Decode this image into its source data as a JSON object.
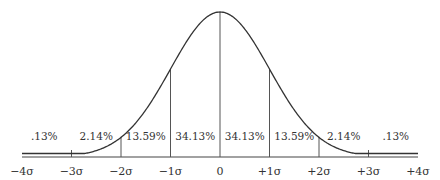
{
  "chart_data": {
    "type": "line",
    "title": "",
    "xlabel": "",
    "ylabel": "",
    "x": [
      -4,
      -3,
      -2,
      -1,
      0,
      1,
      2,
      3,
      4
    ],
    "tick_labels": [
      "−4σ",
      "−3σ",
      "−2σ",
      "−1σ",
      "0",
      "+1σ",
      "+2σ",
      "+3σ",
      "+4σ"
    ],
    "series": [
      {
        "name": "normal density",
        "values": [
          0.0001,
          0.0044,
          0.054,
          0.242,
          0.3989,
          0.242,
          0.054,
          0.0044,
          0.0001
        ]
      }
    ],
    "regions": [
      {
        "from": -4,
        "to": -3,
        "label": ".13%"
      },
      {
        "from": -3,
        "to": -2,
        "label": "2.14%"
      },
      {
        "from": -2,
        "to": -1,
        "label": "13.59%"
      },
      {
        "from": -1,
        "to": 0,
        "label": "34.13%"
      },
      {
        "from": 0,
        "to": 1,
        "label": "34.13%"
      },
      {
        "from": 1,
        "to": 2,
        "label": "13.59%"
      },
      {
        "from": 2,
        "to": 3,
        "label": "2.14%"
      },
      {
        "from": 3,
        "to": 4,
        "label": ".13%"
      }
    ],
    "xlim": [
      -4,
      4
    ],
    "grid": false,
    "legend": "none",
    "colors": {
      "curve": "#333333",
      "lines": "#555555",
      "text": "#333333"
    }
  }
}
